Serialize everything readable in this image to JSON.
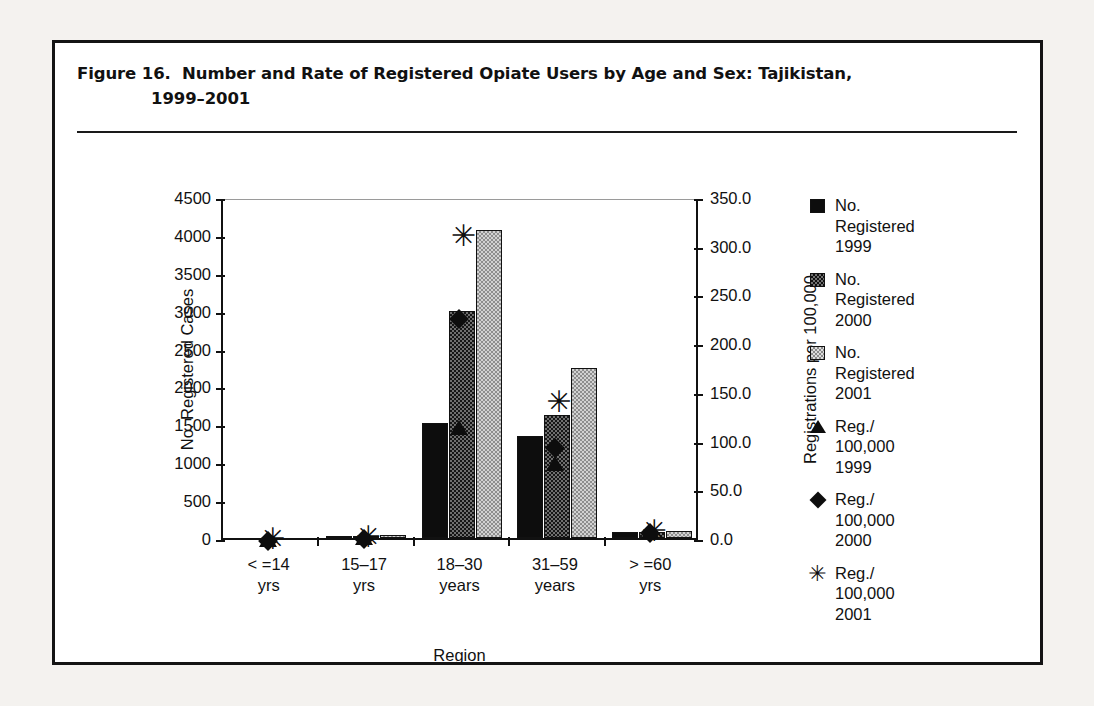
{
  "figure": {
    "title_line1": "Figure 16.  Number and Rate of Registered Opiate Users by Age and Sex: Tajikistan,",
    "title_line2": "1999–2001"
  },
  "chart_data": {
    "type": "bar",
    "title": "Figure 16.  Number and Rate of Registered Opiate Users by Age and Sex: Tajikistan, 1999–2001",
    "categories": [
      "< =14\nyrs",
      "15–17\nyrs",
      "18–30\nyears",
      "31–59\nyears",
      "> =60\nyrs"
    ],
    "xlabel": "Region",
    "ylabel": "No. Registered Cases",
    "ylabel_right": "Registrations per 100,000",
    "ylim": [
      0,
      4500
    ],
    "ylim_right": [
      0.0,
      350.0
    ],
    "yticks": [
      "0",
      "500",
      "1000",
      "1500",
      "2000",
      "2500",
      "3000",
      "3500",
      "4000",
      "4500"
    ],
    "yticks_right": [
      "0.0",
      "50.0",
      "100.0",
      "150.0",
      "200.0",
      "250.0",
      "300.0",
      "350.0"
    ],
    "grid": false,
    "legend_position": "right",
    "series": [
      {
        "name": "No.\nRegistered\n1999",
        "kind": "bar",
        "marker": "square-solid",
        "axis": "left",
        "values": [
          0,
          20,
          1520,
          1340,
          80
        ]
      },
      {
        "name": "No.\nRegistered\n2000",
        "kind": "bar",
        "marker": "square-dark-hatch",
        "axis": "left",
        "values": [
          0,
          30,
          3000,
          1620,
          80
        ]
      },
      {
        "name": "No.\nRegistered\n2001",
        "kind": "bar",
        "marker": "square-light-hatch",
        "axis": "left",
        "values": [
          0,
          35,
          4070,
          2250,
          90
        ]
      },
      {
        "name": "Reg./\n100,000\n1999",
        "kind": "marker",
        "marker": "triangle",
        "axis": "right",
        "values": [
          0.5,
          2.0,
          115.0,
          78.0,
          8.0
        ]
      },
      {
        "name": "Reg./\n100,000\n2000",
        "kind": "marker",
        "marker": "diamond",
        "axis": "right",
        "values": [
          0.5,
          2.5,
          228.0,
          95.0,
          8.5
        ]
      },
      {
        "name": "Reg./\n100,000\n2001",
        "kind": "marker",
        "marker": "asterisk",
        "axis": "right",
        "values": [
          0.6,
          3.0,
          312.0,
          142.0,
          9.0
        ]
      }
    ]
  }
}
